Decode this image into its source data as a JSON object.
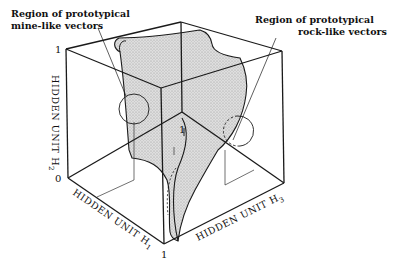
{
  "figure": {
    "annotations": {
      "mine": {
        "line1": "Region of prototypical",
        "line2": "mine-like vectors"
      },
      "rock": {
        "line1": "Region of prototypical",
        "line2": "rock-like vectors"
      }
    },
    "axes": {
      "h1": {
        "label": "HIDDEN UNIT H",
        "sub": "1"
      },
      "h2": {
        "label": "HIDDEN UNIT H",
        "sub": "2"
      },
      "h3": {
        "label": "HIDDEN UNIT H",
        "sub": "3"
      }
    },
    "ticks": {
      "origin": "0",
      "h2_max": "1",
      "h1_max": "1",
      "inner": "1"
    },
    "colors": {
      "line": "#1a1a1a",
      "surface": "#d4d4d4",
      "background": "#ffffff"
    }
  }
}
